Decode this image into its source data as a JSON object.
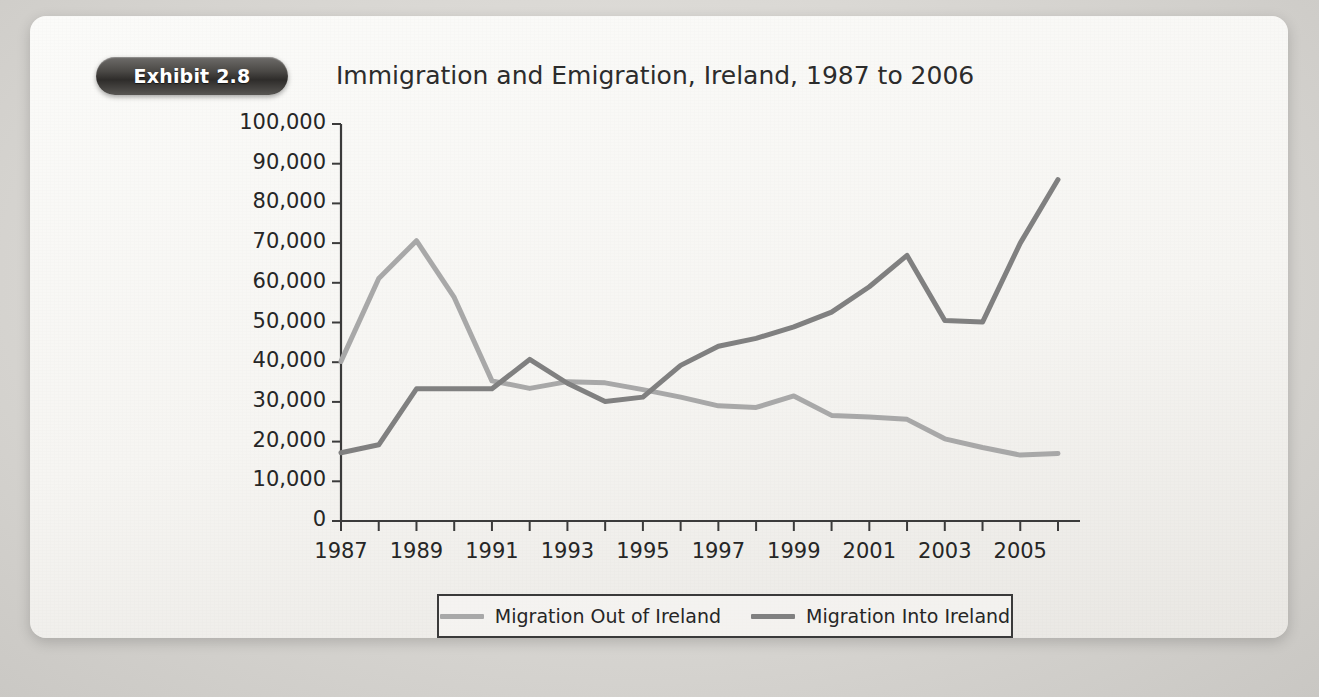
{
  "exhibit": {
    "badge_label": "Exhibit 2.8",
    "title": "Immigration and Emigration, Ireland, 1987 to 2006"
  },
  "chart_data": {
    "type": "line",
    "title": "Immigration and Emigration, Ireland, 1987 to 2006",
    "xlabel": "",
    "ylabel": "",
    "x": [
      1987,
      1988,
      1989,
      1990,
      1991,
      1992,
      1993,
      1994,
      1995,
      1996,
      1997,
      1998,
      1999,
      2000,
      2001,
      2002,
      2003,
      2004,
      2005,
      2006
    ],
    "xlim": [
      1987,
      2006
    ],
    "ylim": [
      0,
      100000
    ],
    "ytick_values": [
      0,
      10000,
      20000,
      30000,
      40000,
      50000,
      60000,
      70000,
      80000,
      90000,
      100000
    ],
    "ytick_labels": [
      "0",
      "10,000",
      "20,000",
      "30,000",
      "40,000",
      "50,000",
      "60,000",
      "70,000",
      "80,000",
      "90,000",
      "100,000"
    ],
    "xtick_labels": [
      "1987",
      "1989",
      "1991",
      "1993",
      "1995",
      "1997",
      "1999",
      "2001",
      "2003",
      "2005"
    ],
    "xtick_values": [
      1987,
      1989,
      1991,
      1993,
      1995,
      1997,
      1999,
      2001,
      2003,
      2005
    ],
    "grid": false,
    "legend_position": "bottom",
    "series": [
      {
        "name": "Migration Out of Ireland",
        "color": "#a8a8a8",
        "values": [
          40200,
          61100,
          70600,
          56300,
          35300,
          33400,
          35100,
          34800,
          33100,
          31200,
          29000,
          28600,
          31500,
          26600,
          26200,
          25600,
          20700,
          18500,
          16600,
          17000
        ]
      },
      {
        "name": "Migration Into Ireland",
        "color": "#808080",
        "values": [
          17200,
          19200,
          33300,
          33300,
          33300,
          40700,
          34700,
          30100,
          31200,
          39200,
          44000,
          46000,
          48900,
          52600,
          59000,
          66900,
          50500,
          50100,
          70000,
          86000
        ]
      }
    ]
  },
  "legend": {
    "items": [
      {
        "label": "Migration Out of Ireland",
        "color": "#a8a8a8"
      },
      {
        "label": "Migration Into Ireland",
        "color": "#808080"
      }
    ]
  }
}
